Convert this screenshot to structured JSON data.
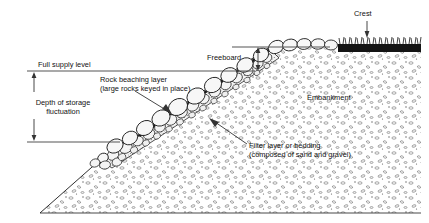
{
  "diagram": {
    "type": "engineering-cross-section",
    "background": "#ffffff",
    "line_color": "#1a1a1a",
    "fill_colors": {
      "embankment_stipple": "#f2f2f2",
      "rock_fill": "#f6f6f6",
      "filter_layer": "#ededed",
      "crest_grass": "#141414",
      "water_line": "#555555"
    }
  },
  "labels": {
    "crest": "Crest",
    "freeboard": "Freeboard",
    "full_supply_level": "Full supply level",
    "depth_line1": "Depth of storage",
    "depth_line2": "fluctuation",
    "rock_line1": "Rock beaching layer",
    "rock_line2": "(large rocks keyed in place)",
    "embankment": "Embankment",
    "filter_line1": "Filter layer or bedding",
    "filter_line2": "(composed of sand and gravel)"
  },
  "geometry": {
    "full_supply_level_y": 71,
    "lower_level_y": 142,
    "crest_level_y": 47,
    "freeboard_arrow_x": 258,
    "depth_arrow_x": 34,
    "water_line_start_x": 27,
    "crest_grass_start_x": 338,
    "crest_grass_end_x": 421
  }
}
